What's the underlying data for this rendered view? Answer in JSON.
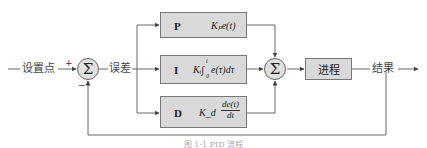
{
  "diagram": {
    "type": "PID control block diagram",
    "inputs": {
      "setpoint_label": "设置点",
      "plus_sign": "+",
      "minus_sign": "−"
    },
    "error_label": "误差",
    "sum_symbol": "Σ",
    "branches": [
      {
        "letter": "P",
        "formula": "Kₚe(t)"
      },
      {
        "letter": "I",
        "formula_prefix": "Kᵢ∫",
        "formula_body": "e(τ)dτ",
        "integral_upper": "t",
        "integral_lower": "0"
      },
      {
        "letter": "D",
        "formula_prefix": "K_d",
        "fraction_num": "de(t)",
        "fraction_den": "dt"
      }
    ],
    "process_label": "进程",
    "output_label": "结果",
    "caption": "图 1-1 PID 流程",
    "colors": {
      "box_fill": "#d9d9d9",
      "circle_fill": "#e0e0e0",
      "line": "#555555"
    }
  }
}
